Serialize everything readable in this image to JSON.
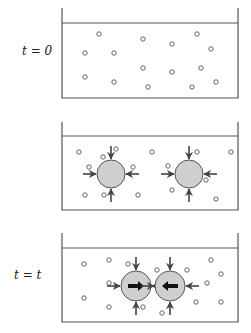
{
  "colors": {
    "line": "#555555",
    "particle_stroke": "#555555",
    "bubble_fill": "#cfcfcf",
    "bubble_stroke": "#555555",
    "arrow": "#444444",
    "thick_arrow": "#111111"
  },
  "panels": [
    {
      "label": "t = 0",
      "label_pos": [
        22,
        46
      ],
      "box": {
        "x": 62,
        "top": 8,
        "water": 23,
        "bottom": 98,
        "right": 238
      },
      "particles": [
        [
          99,
          34
        ],
        [
          143,
          39
        ],
        [
          172,
          44
        ],
        [
          197,
          34
        ],
        [
          85,
          53
        ],
        [
          114,
          53
        ],
        [
          211,
          49
        ],
        [
          143,
          68
        ],
        [
          172,
          72
        ],
        [
          201,
          68
        ],
        [
          85,
          77
        ],
        [
          114,
          82
        ],
        [
          148,
          87
        ],
        [
          192,
          87
        ],
        [
          216,
          82
        ]
      ],
      "bubbles": []
    },
    {
      "label": "",
      "label_pos": [
        0,
        0
      ],
      "box": {
        "x": 62,
        "top": 122,
        "water": 136,
        "bottom": 210,
        "right": 238
      },
      "particles": [
        [
          79,
          152
        ],
        [
          116,
          149
        ],
        [
          103,
          157
        ],
        [
          89,
          167
        ],
        [
          133,
          167
        ],
        [
          152,
          152
        ],
        [
          197,
          152
        ],
        [
          231,
          152
        ],
        [
          168,
          166
        ],
        [
          206,
          180
        ],
        [
          172,
          190
        ],
        [
          85,
          195
        ],
        [
          104,
          195
        ],
        [
          138,
          195
        ],
        [
          216,
          199
        ]
      ],
      "bubbles": [
        {
          "cx": 111,
          "cy": 174,
          "r": 14,
          "inner": null
        },
        {
          "cx": 189,
          "cy": 174,
          "r": 14,
          "inner": null
        }
      ]
    },
    {
      "label": "t = t",
      "label_pos": [
        12,
        270
      ],
      "box": {
        "x": 62,
        "top": 233,
        "water": 248,
        "bottom": 322,
        "right": 238
      },
      "particles": [
        [
          84,
          264
        ],
        [
          109,
          260
        ],
        [
          128,
          264
        ],
        [
          157,
          270
        ],
        [
          187,
          270
        ],
        [
          211,
          260
        ],
        [
          221,
          274
        ],
        [
          109,
          283
        ],
        [
          207,
          283
        ],
        [
          84,
          298
        ],
        [
          109,
          307
        ],
        [
          143,
          307
        ],
        [
          162,
          313
        ],
        [
          196,
          302
        ],
        [
          221,
          302
        ]
      ],
      "bubbles": [
        {
          "cx": 136,
          "cy": 286,
          "r": 15,
          "inner": "right"
        },
        {
          "cx": 170,
          "cy": 286,
          "r": 15,
          "inner": "left"
        }
      ]
    }
  ]
}
